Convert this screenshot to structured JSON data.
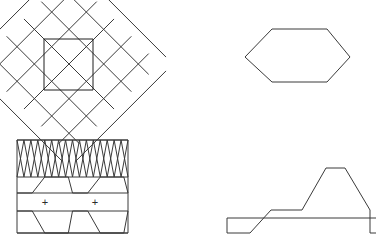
{
  "page": {
    "background_color": "#ffffff",
    "width": 376,
    "height": 251,
    "stroke_color": "#3a3a3a",
    "stroke_color_dark": "#1e1e1e",
    "stroke_width": 1
  },
  "figures": [
    {
      "id": "lattice",
      "name": "diagonal-lattice-with-central-square",
      "description": "Square grid rotated 45 degrees forming a diamond lattice with an empty square window at the centre",
      "bounds": {
        "x": 0,
        "y": 0,
        "width": 140,
        "height": 125
      },
      "lattice": {
        "cell_size": 24.5,
        "rotation_deg": 45,
        "rows": 5,
        "cols": 5,
        "origin_x": 69,
        "origin_y": 64
      },
      "inner_square": {
        "x": 44,
        "y": 39,
        "width": 49,
        "height": 51
      }
    },
    {
      "id": "hexagon",
      "name": "elongated-hexagon",
      "description": "Horizontally elongated hexagon outline with flat top and bottom edges",
      "bounds": {
        "x": 230,
        "y": 0,
        "width": 146,
        "height": 110
      },
      "points": [
        [
          15,
          57
        ],
        [
          42,
          29
        ],
        [
          97,
          29
        ],
        [
          120,
          57
        ],
        [
          97,
          82
        ],
        [
          42,
          82
        ]
      ]
    },
    {
      "id": "banded-box",
      "name": "banded-rectangle-pattern",
      "description": "Rectangle divided into horizontal bands: a dense zigzag band on top, then chevron bands with plus markers",
      "bounds": {
        "x": 0,
        "y": 130,
        "width": 140,
        "height": 121
      },
      "rect": {
        "x": 17,
        "y": 10,
        "width": 111,
        "height": 93
      },
      "dividers_y": [
        10,
        47,
        63,
        81,
        103
      ],
      "zigzag": {
        "top_y": 10,
        "bottom_y": 47,
        "cycles": 8
      },
      "markers": [
        {
          "label": "+",
          "x": 45,
          "y": 72
        },
        {
          "label": "+",
          "x": 95,
          "y": 72
        }
      ]
    },
    {
      "id": "stepped",
      "name": "stepped-profile-polygon",
      "description": "Closed polygon with a stepped ascending left profile, a flat plateau on top and a single step down on the right",
      "bounds": {
        "x": 220,
        "y": 125,
        "width": 156,
        "height": 126
      },
      "points": [
        [
          7,
          93
        ],
        [
          7,
          108
        ],
        [
          30,
          108
        ],
        [
          51,
          85
        ],
        [
          82,
          85
        ],
        [
          106,
          43
        ],
        [
          125,
          43
        ],
        [
          150,
          85
        ],
        [
          150,
          108
        ],
        [
          163,
          108
        ],
        [
          163,
          93
        ]
      ]
    }
  ]
}
